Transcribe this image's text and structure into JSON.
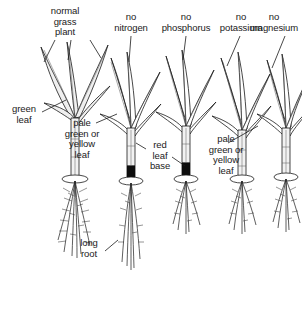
{
  "figure": {
    "title_labels": [
      {
        "id": "normal-grass-plant",
        "text": "normal\ngrass\nplant"
      },
      {
        "id": "no-nitrogen",
        "text": "no\nnitrogen"
      },
      {
        "id": "no-phosphorus",
        "text": "no\nphosphorus"
      },
      {
        "id": "no-potassium",
        "text": "no\npotassium"
      },
      {
        "id": "no-magnesium",
        "text": "no\nmagnesium"
      }
    ],
    "annotations": [
      {
        "id": "green-leaf",
        "text": "green\nleaf"
      },
      {
        "id": "pale-green-or-yellow-leaf-nitrogen",
        "text": "pale\ngreen or\nyellow\nleaf"
      },
      {
        "id": "red-leaf-base",
        "text": "red\nleaf\nbase"
      },
      {
        "id": "pale-green-or-yellow-leaf-magnesium",
        "text": "pale\ngreen or\nyellow\nleaf"
      },
      {
        "id": "long-root",
        "text": "long\nroot"
      }
    ],
    "caption": "",
    "plants": [
      {
        "id": "plant-normal",
        "label": "normal grass plant",
        "leaf_shade": "green",
        "base_shade": "pale",
        "root_length": "long"
      },
      {
        "id": "plant-no-nitrogen",
        "label": "no nitrogen",
        "leaf_shade": "pale-yellow",
        "base_shade": "dark",
        "root_length": "long"
      },
      {
        "id": "plant-no-phosphorus",
        "label": "no phosphorus",
        "leaf_shade": "pale",
        "base_shade": "dark-red",
        "root_length": "short"
      },
      {
        "id": "plant-no-potassium",
        "label": "no potassium",
        "leaf_shade": "pale",
        "base_shade": "pale",
        "root_length": "short"
      },
      {
        "id": "plant-no-magnesium",
        "label": "no magnesium",
        "leaf_shade": "pale-yellow",
        "base_shade": "pale",
        "root_length": "short"
      }
    ],
    "colors": {
      "ink": "#1a1a1a",
      "blade_fill": "#efefef",
      "dark_base": "#0d0d0d",
      "background": "#ffffff"
    }
  }
}
